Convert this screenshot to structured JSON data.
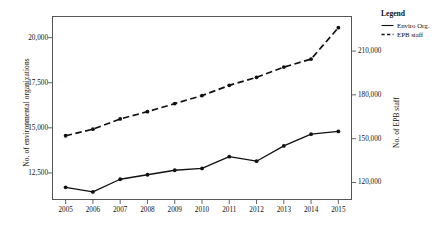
{
  "chart_data": {
    "type": "line",
    "title": "",
    "xlabel": "",
    "ylabel": "No. of environmental organizations",
    "y2label": "No. of EPB staff",
    "grid": false,
    "legend_position": "right",
    "categories": [
      "2005",
      "2006",
      "2007",
      "2008",
      "2009",
      "2010",
      "2011",
      "2012",
      "2013",
      "2014",
      "2015"
    ],
    "x": [
      2005,
      2006,
      2007,
      2008,
      2009,
      2010,
      2011,
      2012,
      2013,
      2014,
      2015
    ],
    "ylim": [
      11000,
      21200
    ],
    "yticks": [
      12500,
      15000,
      17500,
      20000
    ],
    "ytick_labels": [
      "12,500",
      "15,000",
      "17,500",
      "20,000"
    ],
    "y2lim": [
      108000,
      234000
    ],
    "y2ticks": [
      120000,
      150000,
      180000,
      210000
    ],
    "y2tick_labels": [
      "120,000",
      "150,000",
      "180,000",
      "210,000"
    ],
    "series": [
      {
        "name": "Enviro Org.",
        "axis": "left",
        "style": "solid",
        "marker": "filled-circle",
        "color": "#111111",
        "values": [
          11700,
          11450,
          12150,
          12400,
          12650,
          12750,
          13400,
          13150,
          14000,
          14650,
          14800
        ]
      },
      {
        "name": "EPB staff",
        "axis": "right",
        "style": "dashed",
        "marker": "filled-circle",
        "color": "#111111",
        "values": [
          152000,
          156500,
          163500,
          168500,
          174000,
          179500,
          186500,
          192000,
          199000,
          204500,
          226000
        ]
      }
    ]
  },
  "legend": {
    "title": "Legend",
    "items": [
      {
        "label": "Enviro Org.",
        "style": "solid"
      },
      {
        "label": "EPB staff",
        "style": "dashed"
      }
    ]
  }
}
